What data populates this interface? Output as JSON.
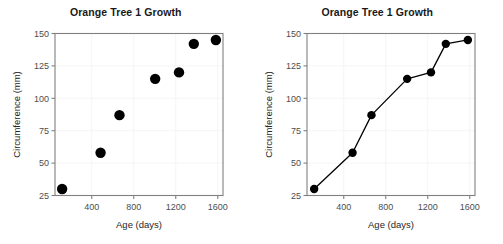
{
  "figure": {
    "background_color": "#ffffff",
    "panel_count": 2
  },
  "chart_data": [
    {
      "type": "scatter",
      "title": "Orange Tree 1 Growth",
      "xlabel": "Age (days)",
      "ylabel": "Circumference (mm)",
      "x": [
        118,
        484,
        664,
        1004,
        1231,
        1372,
        1582
      ],
      "values": [
        30,
        58,
        87,
        115,
        120,
        142,
        145
      ],
      "xlim": [
        50,
        1650
      ],
      "ylim": [
        25,
        150
      ],
      "xticks": [
        400,
        800,
        1200,
        1600
      ],
      "yticks": [
        25,
        50,
        75,
        100,
        125,
        150
      ],
      "xtick_labels": [
        "400",
        "800",
        "1200",
        "1600"
      ],
      "ytick_labels": [
        "25",
        "50",
        "75",
        "100",
        "125",
        "150"
      ],
      "grid": true,
      "legend": "none",
      "marker_color": "#000000",
      "marker_size": 5.2
    },
    {
      "type": "line",
      "title": "Orange Tree 1 Growth",
      "xlabel": "Age (days)",
      "ylabel": "Circumference (mm)",
      "x": [
        118,
        484,
        664,
        1004,
        1231,
        1372,
        1582
      ],
      "values": [
        30,
        58,
        87,
        115,
        120,
        142,
        145
      ],
      "xlim": [
        50,
        1650
      ],
      "ylim": [
        25,
        150
      ],
      "xticks": [
        400,
        800,
        1200,
        1600
      ],
      "yticks": [
        25,
        50,
        75,
        100,
        125,
        150
      ],
      "xtick_labels": [
        "400",
        "800",
        "1200",
        "1600"
      ],
      "ytick_labels": [
        "25",
        "50",
        "75",
        "100",
        "125",
        "150"
      ],
      "grid": true,
      "legend": "none",
      "marker_color": "#000000",
      "line_color": "#000000",
      "marker_size": 4.2
    }
  ]
}
